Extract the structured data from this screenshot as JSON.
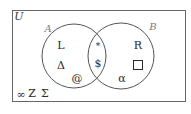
{
  "diagram": {
    "type": "venn",
    "universe_label": "U",
    "sets": [
      {
        "label": "A"
      },
      {
        "label": "B"
      }
    ],
    "regions": {
      "a_only": [
        "L",
        "Δ",
        "@"
      ],
      "intersection": [
        "*",
        "$"
      ],
      "b_only": [
        "R",
        "□",
        "α"
      ],
      "outside": [
        "∞",
        "Z",
        "Σ"
      ]
    }
  },
  "labels": {
    "U": "U",
    "A": "A",
    "B": "B",
    "L": "L",
    "delta": "Δ",
    "at": "@",
    "star": "*",
    "dollar": "$",
    "R": "R",
    "alpha": "α",
    "infinity": "∞",
    "Z": "Z",
    "sigma": "Σ"
  },
  "colors": {
    "stroke": "#555555",
    "text": "#2a2a2a",
    "set_label": "#7a7a7a",
    "background": "#ffffff"
  }
}
